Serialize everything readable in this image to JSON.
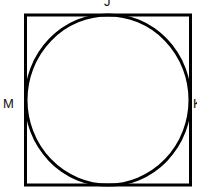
{
  "diagram": {
    "shape": "circle inscribed in square",
    "labels": {
      "top": "J",
      "left": "M",
      "right": "K"
    },
    "stroke_color": "#000000",
    "background": "#ffffff"
  }
}
